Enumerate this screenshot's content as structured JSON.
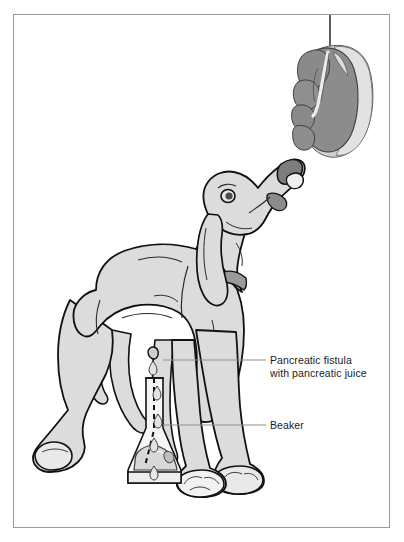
{
  "figure": {
    "frame_border_color": "#9a9a9a",
    "background_color": "#ffffff"
  },
  "labels": [
    {
      "id": "pancreatic-fistula",
      "line1": "Pancreatic fistula",
      "line2": "with pancreatic juice",
      "leader_line": true
    },
    {
      "id": "beaker",
      "line1": "Beaker",
      "line2": "",
      "leader_line": true
    }
  ],
  "elements": {
    "dog": {
      "name": "dog",
      "body_fill": "#dcdcdc",
      "outline": "#111111",
      "collar_fill": "#9a9a9a",
      "nose_fill": "#7d7d7d",
      "eye_fill": "#4a4a4a"
    },
    "meat": {
      "name": "suspended-meat",
      "inner_fill": "#8c8c8c",
      "outer_fill": "#d2d2d2",
      "outline": "#4a4a4a",
      "string_color": "#1b1b1b"
    },
    "beaker": {
      "name": "erlenmeyer-flask",
      "glass_fill": "#f4f4f4",
      "outline": "#1b1b1b",
      "tube_color": "#111111",
      "liquid_fill": "#d8d8d8"
    },
    "leader_line_color": "#8f8f8f"
  }
}
